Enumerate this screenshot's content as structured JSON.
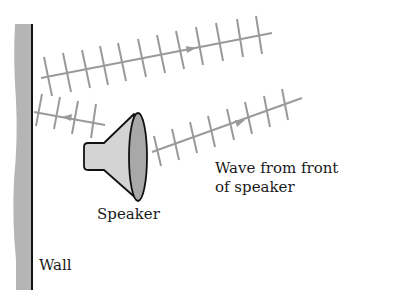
{
  "diagram": {
    "labels": {
      "wall": "Wall",
      "speaker": "Speaker",
      "wave_line1": "Wave from front",
      "wave_line2": "of speaker"
    },
    "elements": [
      {
        "name": "wall",
        "type": "vertical-surface"
      },
      {
        "name": "speaker",
        "type": "loudspeaker"
      },
      {
        "name": "wave-from-back-toward-wall",
        "direction": "left"
      },
      {
        "name": "reflected-wave-from-wall",
        "direction": "right"
      },
      {
        "name": "wave-from-front-of-speaker",
        "direction": "right"
      }
    ],
    "colors": {
      "wall_fill": "#b5b5b5",
      "wall_line": "#111111",
      "wave": "#9a9a9a",
      "speaker_body": "#d4d4d4",
      "speaker_face": "#a8a8a8"
    }
  }
}
